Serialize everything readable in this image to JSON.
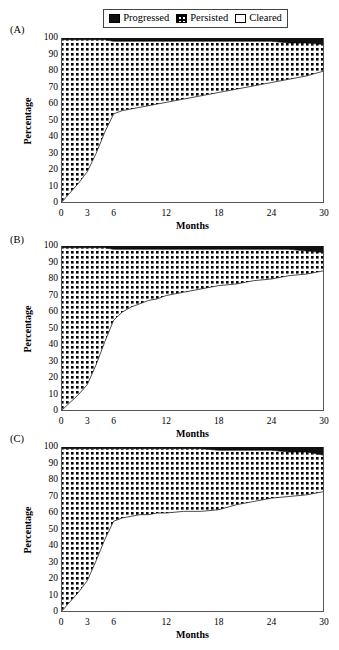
{
  "legend": {
    "items": [
      {
        "label": "Progressed",
        "swatch": "black-square-icon",
        "color": "#111111"
      },
      {
        "label": "Persisted",
        "swatch": "checkered-square-icon",
        "color": "#000000"
      },
      {
        "label": "Cleared",
        "swatch": "white-square-icon",
        "color": "#ffffff"
      }
    ]
  },
  "axes": {
    "ylabel": "Percentage",
    "xlabel": "Months",
    "yticks": [
      0,
      10,
      20,
      30,
      40,
      50,
      60,
      70,
      80,
      90,
      100
    ],
    "xticks": [
      0,
      3,
      6,
      12,
      18,
      24,
      30
    ],
    "ylim": [
      0,
      100
    ],
    "xlim": [
      0,
      30
    ]
  },
  "panels": [
    {
      "tag": "(A)"
    },
    {
      "tag": "(B)"
    },
    {
      "tag": "(C)"
    }
  ],
  "chart_data": [
    {
      "type": "area",
      "panel": "(A)",
      "title": "",
      "xlabel": "Months",
      "ylabel": "Percentage",
      "xlim": [
        0,
        30
      ],
      "ylim": [
        0,
        100
      ],
      "grid": false,
      "legend_position": "top-center",
      "x": [
        0,
        1,
        2,
        3,
        4,
        5,
        6,
        7,
        8,
        9,
        10,
        11,
        12,
        14,
        16,
        18,
        20,
        22,
        24,
        26,
        28,
        30
      ],
      "series": [
        {
          "name": "Cleared",
          "values": [
            0,
            6,
            12,
            19,
            30,
            43,
            54,
            56,
            57,
            58,
            59,
            60,
            61,
            63,
            65,
            67,
            69,
            71,
            73,
            75,
            77,
            80
          ]
        },
        {
          "name": "Persisted",
          "values": [
            99,
            93,
            87,
            80,
            69,
            56,
            44,
            42,
            41,
            40,
            39,
            38,
            37,
            35,
            33,
            31,
            29,
            27,
            25,
            22,
            20,
            16
          ]
        },
        {
          "name": "Progressed",
          "values": [
            1,
            1,
            1,
            1,
            1,
            1,
            2,
            2,
            2,
            2,
            2,
            2,
            2,
            2,
            2,
            2,
            2,
            2,
            2,
            3,
            3,
            4
          ]
        }
      ]
    },
    {
      "type": "area",
      "panel": "(B)",
      "title": "",
      "xlabel": "Months",
      "ylabel": "Percentage",
      "xlim": [
        0,
        30
      ],
      "ylim": [
        0,
        100
      ],
      "grid": false,
      "legend_position": "top-center",
      "x": [
        0,
        1,
        2,
        3,
        4,
        5,
        6,
        7,
        8,
        9,
        10,
        11,
        12,
        14,
        16,
        18,
        20,
        22,
        24,
        26,
        28,
        30
      ],
      "series": [
        {
          "name": "Cleared",
          "values": [
            0,
            5,
            10,
            16,
            28,
            42,
            55,
            60,
            63,
            65,
            67,
            68,
            70,
            72,
            74,
            76,
            77,
            79,
            80,
            82,
            83,
            85
          ]
        },
        {
          "name": "Persisted",
          "values": [
            99,
            94,
            89,
            83,
            71,
            57,
            43,
            38,
            35,
            33,
            31,
            30,
            28,
            26,
            24,
            22,
            21,
            19,
            18,
            16,
            14,
            11
          ]
        },
        {
          "name": "Progressed",
          "values": [
            1,
            1,
            1,
            1,
            1,
            1,
            2,
            2,
            2,
            2,
            2,
            2,
            2,
            2,
            2,
            2,
            2,
            2,
            2,
            2,
            3,
            4
          ]
        }
      ]
    },
    {
      "type": "area",
      "panel": "(C)",
      "title": "",
      "xlabel": "Months",
      "ylabel": "Percentage",
      "xlim": [
        0,
        30
      ],
      "ylim": [
        0,
        100
      ],
      "grid": false,
      "legend_position": "top-center",
      "x": [
        0,
        1,
        2,
        3,
        4,
        5,
        6,
        7,
        8,
        9,
        10,
        11,
        12,
        14,
        16,
        18,
        20,
        22,
        24,
        26,
        28,
        30
      ],
      "series": [
        {
          "name": "Cleared",
          "values": [
            0,
            6,
            12,
            19,
            31,
            44,
            55,
            57,
            58,
            59,
            59,
            60,
            60,
            61,
            61,
            62,
            65,
            67,
            69,
            70,
            71,
            73
          ]
        },
        {
          "name": "Persisted",
          "values": [
            99,
            93,
            87,
            80,
            68,
            55,
            44,
            42,
            41,
            40,
            40,
            39,
            39,
            38,
            38,
            36,
            33,
            31,
            29,
            27,
            26,
            22
          ]
        },
        {
          "name": "Progressed",
          "values": [
            1,
            1,
            1,
            1,
            1,
            1,
            1,
            1,
            1,
            1,
            1,
            1,
            1,
            1,
            1,
            2,
            2,
            2,
            2,
            3,
            3,
            5
          ]
        }
      ]
    }
  ]
}
